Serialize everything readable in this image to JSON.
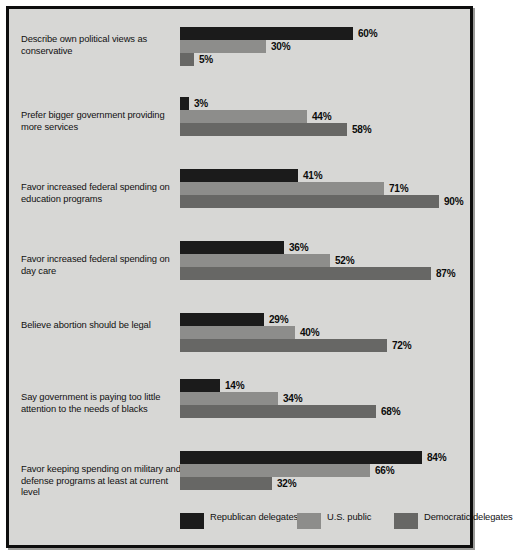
{
  "chart_data": {
    "type": "bar",
    "orientation": "horizontal",
    "title": "",
    "subtitle": "",
    "xlabel": "",
    "ylabel": "",
    "xlim": [
      0,
      100
    ],
    "grid": false,
    "legend_position": "bottom",
    "value_suffix": "%",
    "categories": [
      "Describe own political views as conservative",
      "Prefer bigger government providing more services",
      "Favor increased federal spending on education programs",
      "Favor increased federal spending on day care",
      "Believe abortion should be legal",
      "Say government is paying too little attention to the needs of blacks",
      "Favor keeping spending on military and defense programs at least at current level"
    ],
    "series": [
      {
        "name": "Republican delegates",
        "color": "#1b1b1b",
        "values": [
          60,
          3,
          41,
          36,
          29,
          14,
          84
        ],
        "labels": [
          "60%",
          "3%",
          "41%",
          "36%",
          "29%",
          "14%",
          "84%"
        ]
      },
      {
        "name": "U.S. public",
        "color": "#8d8d8b",
        "values": [
          30,
          44,
          71,
          52,
          40,
          34,
          66
        ],
        "labels": [
          "30%",
          "44%",
          "71%",
          "52%",
          "40%",
          "34%",
          "66%"
        ]
      },
      {
        "name": "Democratic delegates",
        "color": "#676765",
        "values": [
          5,
          58,
          90,
          87,
          72,
          68,
          32
        ],
        "labels": [
          "5%",
          "58%",
          "90%",
          "87%",
          "72%",
          "68%",
          "32%"
        ]
      }
    ]
  },
  "groups": [
    {
      "label": "Describe own political views as conservative",
      "label_top": 24,
      "bars_top": 18,
      "rows": [
        {
          "value": 60,
          "label": "60%",
          "color": "#1b1b1b",
          "series": "Republican delegates"
        },
        {
          "value": 30,
          "label": "30%",
          "color": "#8d8d8b",
          "series": "U.S. public"
        },
        {
          "value": 5,
          "label": "5%",
          "color": "#676765",
          "series": "Democratic delegates"
        }
      ]
    },
    {
      "label": "Prefer bigger government providing more services",
      "label_top": 100,
      "bars_top": 88,
      "rows": [
        {
          "value": 3,
          "label": "3%",
          "color": "#1b1b1b",
          "series": "Republican delegates"
        },
        {
          "value": 44,
          "label": "44%",
          "color": "#8d8d8b",
          "series": "U.S. public"
        },
        {
          "value": 58,
          "label": "58%",
          "color": "#676765",
          "series": "Democratic delegates"
        }
      ]
    },
    {
      "label": "Favor increased federal spending on education programs",
      "label_top": 172,
      "bars_top": 160,
      "rows": [
        {
          "value": 41,
          "label": "41%",
          "color": "#1b1b1b",
          "series": "Republican delegates"
        },
        {
          "value": 71,
          "label": "71%",
          "color": "#8d8d8b",
          "series": "U.S. public"
        },
        {
          "value": 90,
          "label": "90%",
          "color": "#676765",
          "series": "Democratic delegates"
        }
      ]
    },
    {
      "label": "Favor increased federal spending on day care",
      "label_top": 244,
      "bars_top": 232,
      "rows": [
        {
          "value": 36,
          "label": "36%",
          "color": "#1b1b1b",
          "series": "Republican delegates"
        },
        {
          "value": 52,
          "label": "52%",
          "color": "#8d8d8b",
          "series": "U.S. public"
        },
        {
          "value": 87,
          "label": "87%",
          "color": "#676765",
          "series": "Democratic delegates"
        }
      ]
    },
    {
      "label": "Believe abortion should be legal",
      "label_top": 310,
      "bars_top": 304,
      "rows": [
        {
          "value": 29,
          "label": "29%",
          "color": "#1b1b1b",
          "series": "Republican delegates"
        },
        {
          "value": 40,
          "label": "40%",
          "color": "#8d8d8b",
          "series": "U.S. public"
        },
        {
          "value": 72,
          "label": "72%",
          "color": "#676765",
          "series": "Democratic delegates"
        }
      ]
    },
    {
      "label": "Say government is paying too little attention to the needs of blacks",
      "label_top": 382,
      "bars_top": 370,
      "rows": [
        {
          "value": 14,
          "label": "14%",
          "color": "#1b1b1b",
          "series": "Republican delegates"
        },
        {
          "value": 34,
          "label": "34%",
          "color": "#8d8d8b",
          "series": "U.S. public"
        },
        {
          "value": 68,
          "label": "68%",
          "color": "#676765",
          "series": "Democratic delegates"
        }
      ]
    },
    {
      "label": "Favor keeping spending on military and defense programs at least at current level",
      "label_top": 454,
      "bars_top": 442,
      "rows": [
        {
          "value": 84,
          "label": "84%",
          "color": "#1b1b1b",
          "series": "Republican delegates"
        },
        {
          "value": 66,
          "label": "66%",
          "color": "#8d8d8b",
          "series": "U.S. public"
        },
        {
          "value": 32,
          "label": "32%",
          "color": "#676765",
          "series": "Democratic delegates"
        }
      ]
    }
  ],
  "legend": {
    "items": [
      {
        "label": "Republican delegates",
        "color": "#1b1b1b",
        "left": 171
      },
      {
        "label": "U.S. public",
        "color": "#8d8d8b",
        "left": 288
      },
      {
        "label": "Democratic delegates",
        "color": "#676765",
        "left": 385
      }
    ]
  },
  "scale": {
    "px_per_percent": 2.88
  }
}
